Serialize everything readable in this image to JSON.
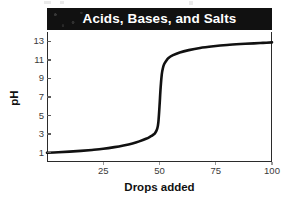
{
  "chart_data": {
    "type": "line",
    "title": "Acids, Bases, and Salts",
    "xlabel": "Drops added",
    "ylabel": "pH",
    "xlim": [
      0,
      100
    ],
    "ylim": [
      0,
      14
    ],
    "grid": false,
    "legend": null,
    "x_ticks": [
      25,
      50,
      75,
      100
    ],
    "x_tick_labels": [
      "25",
      "50",
      "75",
      "100"
    ],
    "y_ticks": [
      1,
      3,
      5,
      7,
      9,
      11,
      13
    ],
    "y_tick_labels": [
      "1",
      "3",
      "5",
      "7",
      "9",
      "11",
      "13"
    ],
    "series": [
      {
        "name": "Titration curve",
        "color": "#111111",
        "x": [
          0,
          5,
          10,
          15,
          20,
          25,
          30,
          34,
          38,
          41,
          44,
          46,
          47,
          48,
          49,
          49.5,
          50,
          50.5,
          51,
          51.5,
          52,
          53,
          54,
          56,
          59,
          63,
          68,
          74,
          80,
          86,
          92,
          96,
          100
        ],
        "y": [
          1.0,
          1.05,
          1.12,
          1.2,
          1.3,
          1.42,
          1.6,
          1.78,
          2.0,
          2.22,
          2.5,
          2.75,
          2.9,
          3.1,
          3.6,
          4.3,
          6.0,
          8.0,
          9.4,
          10.1,
          10.5,
          10.9,
          11.2,
          11.5,
          11.8,
          12.05,
          12.28,
          12.46,
          12.6,
          12.7,
          12.78,
          12.83,
          12.88
        ]
      }
    ],
    "annotations": []
  },
  "figure": {
    "title_band": {
      "label": "Acids, Bases, and Salts",
      "background": "#111111",
      "text_color": "#ffffff"
    },
    "axes": {
      "y_title": "pH",
      "x_title": "Drops added",
      "frame_color": "#2b2b2b",
      "tick_text_color": "#3a3a3a"
    },
    "curve_color": "#111111",
    "background": "#ffffff"
  }
}
